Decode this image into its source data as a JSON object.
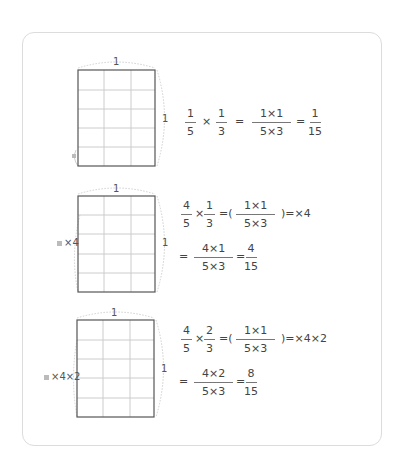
{
  "diagram": {
    "grid": {
      "rows": 5,
      "cols": 3,
      "line_color": "#c8c8c8",
      "border_color": "#555555",
      "cell_marker_color": "#bbbbbb"
    },
    "panels": [
      {
        "top_label": "1",
        "side_label": "1",
        "marker_label": "",
        "equation": {
          "line1": [
            {
              "type": "frac",
              "num": "1",
              "den": "5"
            },
            {
              "type": "op",
              "text": "×"
            },
            {
              "type": "frac",
              "num": "1",
              "den": "3"
            },
            {
              "type": "op",
              "text": "="
            },
            {
              "type": "frac",
              "num": "1×1",
              "den": "5×3"
            },
            {
              "type": "op",
              "text": "="
            },
            {
              "type": "frac",
              "num": "1",
              "den": "15"
            }
          ]
        }
      },
      {
        "top_label": "1",
        "side_label": "1",
        "marker_label": "×4",
        "equation": {
          "line1": [
            {
              "type": "frac",
              "num": "4",
              "den": "5"
            },
            {
              "type": "op",
              "text": "×"
            },
            {
              "type": "frac",
              "num": "1",
              "den": "3"
            },
            {
              "type": "op",
              "text": "=("
            },
            {
              "type": "frac",
              "num": "1×1",
              "den": "5×3"
            },
            {
              "type": "op",
              "text": ")=×4"
            }
          ],
          "line2": [
            {
              "type": "op",
              "text": "="
            },
            {
              "type": "frac",
              "num": "4×1",
              "den": "5×3"
            },
            {
              "type": "op",
              "text": "="
            },
            {
              "type": "frac",
              "num": "4",
              "den": "15"
            }
          ]
        }
      },
      {
        "top_label": "1",
        "side_label": "1",
        "marker_label": "×4×2",
        "equation": {
          "line1": [
            {
              "type": "frac",
              "num": "4",
              "den": "5"
            },
            {
              "type": "op",
              "text": "×"
            },
            {
              "type": "frac",
              "num": "2",
              "den": "3"
            },
            {
              "type": "op",
              "text": "=("
            },
            {
              "type": "frac",
              "num": "1×1",
              "den": "5×3"
            },
            {
              "type": "op",
              "text": ")=×4×2"
            }
          ],
          "line2": [
            {
              "type": "op",
              "text": "="
            },
            {
              "type": "frac",
              "num": "4×2",
              "den": "5×3"
            },
            {
              "type": "op",
              "text": "="
            },
            {
              "type": "frac",
              "num": "8",
              "den": "15"
            }
          ]
        }
      }
    ]
  }
}
